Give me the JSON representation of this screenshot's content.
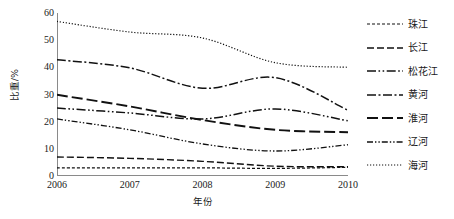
{
  "chart_data": {
    "type": "line",
    "title": "",
    "xlabel": "年份",
    "ylabel": "比重/%",
    "x": [
      2006,
      2007,
      2008,
      2009,
      2010
    ],
    "xtick_labels": [
      "2006",
      "2007",
      "2008",
      "2009",
      "2010"
    ],
    "ytick_labels": [
      "0",
      "10",
      "20",
      "30",
      "40",
      "50",
      "60"
    ],
    "ytick_values": [
      0,
      10,
      20,
      30,
      40,
      50,
      60
    ],
    "ylim": [
      0,
      60
    ],
    "xlim": [
      2006,
      2010
    ],
    "grid": false,
    "legend_position": "right",
    "series": [
      {
        "name": "珠江",
        "values": [
          3.0,
          3.0,
          3.0,
          2.8,
          3.2
        ],
        "dash": "3,2",
        "width": 1.2,
        "color": "#111111"
      },
      {
        "name": "长江",
        "values": [
          7.0,
          6.5,
          5.4,
          3.6,
          3.4
        ],
        "dash": "7,3",
        "width": 1.4,
        "color": "#111111"
      },
      {
        "name": "松花江",
        "values": [
          25.0,
          23.2,
          21.0,
          24.7,
          20.3
        ],
        "dash": "9,2.5,1.6,2.5,1.6,2.5",
        "width": 1.5,
        "color": "#111111"
      },
      {
        "name": "黄河",
        "values": [
          42.8,
          39.8,
          32.3,
          36.2,
          24.2
        ],
        "dash": "9,2.5,2,2.5",
        "width": 1.5,
        "color": "#111111"
      },
      {
        "name": "淮河",
        "values": [
          29.9,
          25.6,
          20.6,
          17.0,
          16.1
        ],
        "dash": "11,4",
        "width": 1.9,
        "color": "#111111"
      },
      {
        "name": "辽河",
        "values": [
          21.0,
          17.0,
          11.8,
          9.2,
          11.5
        ],
        "dash": "6,2,1.4,2,1.4,2",
        "width": 1.3,
        "color": "#111111"
      },
      {
        "name": "海河",
        "values": [
          56.9,
          53.0,
          50.8,
          41.7,
          40.0
        ],
        "dash": "1.2,1.8",
        "width": 1.2,
        "color": "#111111"
      }
    ]
  },
  "axes": {
    "y_title": "比重/%",
    "x_title": "年份"
  }
}
